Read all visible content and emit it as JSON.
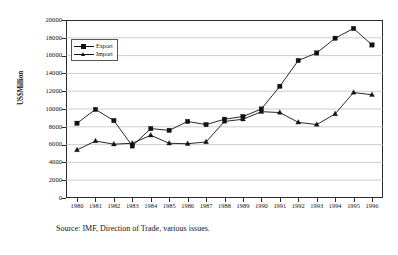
{
  "chart_data": {
    "type": "line",
    "title": "",
    "subtitle": "",
    "xlabel": "",
    "ylabel": "US$Million",
    "ylim": [
      0,
      20000
    ],
    "ytick_step": 2000,
    "yticks": [
      "0",
      "2000",
      "4000",
      "6000",
      "8000",
      "10000",
      "12000",
      "14000",
      "16000",
      "18000",
      "20000"
    ],
    "grid": true,
    "grid_axis": "y",
    "legend_position": "top-left-inside",
    "categories": [
      "1980",
      "1981",
      "1982",
      "1983",
      "1984",
      "1985",
      "1986",
      "1987",
      "1988",
      "1989",
      "1990",
      "1991",
      "1992",
      "1993",
      "1994",
      "1995",
      "1996"
    ],
    "series": [
      {
        "name": "Export",
        "marker": "square",
        "color": "#111111",
        "values": [
          8400,
          9950,
          8700,
          5850,
          7800,
          7600,
          8600,
          8250,
          8850,
          9150,
          10000,
          12550,
          15450,
          16300,
          17950,
          19050,
          17200
        ]
      },
      {
        "name": "Import",
        "marker": "triangle",
        "color": "#111111",
        "values": [
          5400,
          6400,
          6050,
          6150,
          7050,
          6150,
          6100,
          6300,
          8600,
          8850,
          9700,
          9600,
          8500,
          8250,
          9450,
          11850,
          11600
        ]
      }
    ],
    "annotations": [
      "Source: IMF, Direction of Trade, various issues."
    ]
  },
  "legend": {
    "items": [
      {
        "label": "Export"
      },
      {
        "label": "Import"
      }
    ]
  },
  "caption": {
    "source_text": "Source: IMF, Direction of Trade, various issues."
  },
  "colors": {
    "line": "#111111",
    "grid": "#b8b8b8",
    "axis": "#2b2b2b",
    "background": "#ffffff"
  }
}
